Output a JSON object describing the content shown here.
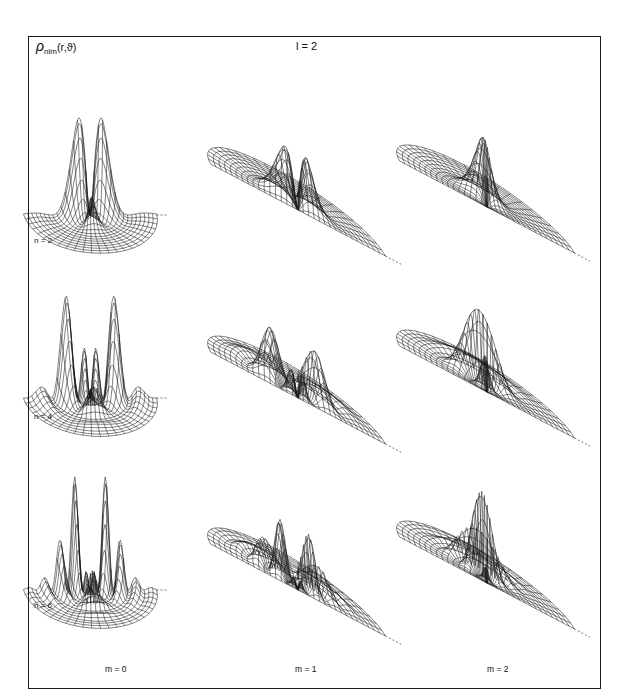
{
  "figure": {
    "title_symbol": "ρ",
    "title_subscript": "nlm",
    "title_args": "(r,ϑ)",
    "l_label": "l = 2",
    "row_labels": [
      "n = 2",
      "n = 4",
      "n = 6"
    ],
    "column_labels": [
      "m = 0",
      "m = 1",
      "m = 2"
    ],
    "line_color": "#1a1a1a",
    "background": "#ffffff"
  },
  "chart_data": {
    "type": "surface-grid",
    "rows": [
      "n=2",
      "n=4",
      "n=6"
    ],
    "columns": [
      "m=0",
      "m=1",
      "m=2"
    ],
    "panels": [
      {
        "n": 2,
        "m": 0,
        "peaks": 2,
        "relative_height": 1.0,
        "radial_nodes": 0,
        "mesh_tilt": "high"
      },
      {
        "n": 2,
        "m": 1,
        "peaks": 2,
        "relative_height": 0.55,
        "radial_nodes": 0,
        "mesh_tilt": "low"
      },
      {
        "n": 2,
        "m": 2,
        "peaks": 1,
        "relative_height": 0.65,
        "radial_nodes": 0,
        "mesh_tilt": "low"
      },
      {
        "n": 4,
        "m": 0,
        "peaks": 2,
        "relative_height": 1.05,
        "radial_nodes": 1,
        "mesh_tilt": "high"
      },
      {
        "n": 4,
        "m": 1,
        "peaks": 2,
        "relative_height": 0.5,
        "radial_nodes": 1,
        "mesh_tilt": "low"
      },
      {
        "n": 4,
        "m": 2,
        "peaks": 1,
        "relative_height": 0.7,
        "radial_nodes": 1,
        "mesh_tilt": "low"
      },
      {
        "n": 6,
        "m": 0,
        "peaks": 2,
        "relative_height": 1.1,
        "radial_nodes": 2,
        "mesh_tilt": "high"
      },
      {
        "n": 6,
        "m": 1,
        "peaks": 2,
        "relative_height": 0.55,
        "radial_nodes": 2,
        "mesh_tilt": "low"
      },
      {
        "n": 6,
        "m": 2,
        "peaks": 1,
        "relative_height": 0.8,
        "radial_nodes": 2,
        "mesh_tilt": "low"
      }
    ]
  }
}
